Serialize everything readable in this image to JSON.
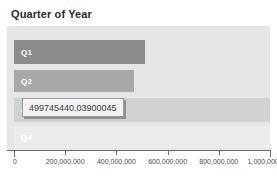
{
  "chart_data": {
    "type": "bar",
    "orientation": "horizontal",
    "title": "Quarter of Year",
    "xlabel": "",
    "ylabel": "",
    "categories": [
      "Q1",
      "Q2",
      "Q3",
      "Q4"
    ],
    "values": [
      513000000,
      468000000,
      1000000000,
      1060000000
    ],
    "xlim": [
      0,
      1060000000
    ],
    "axis_max_tick": 1000000000,
    "grid": false,
    "legend": "none",
    "tick_values": [
      0,
      200000000,
      400000000,
      600000000,
      800000000,
      1000000000
    ],
    "tick_labels": [
      "0",
      "200,000,000",
      "400,000,000",
      "600,000,000",
      "800,000,000",
      "1,000,000,000"
    ],
    "bars": [
      {
        "label": "Q1",
        "value": 513000000,
        "color": "#8c8c8c",
        "label_color": "#ffffff"
      },
      {
        "label": "Q2",
        "value": 468000000,
        "color": "#a8a8a8",
        "label_color": "#ffffff"
      },
      {
        "label": "Q3",
        "value": 1000000000,
        "color": "#d2d2d2",
        "label_color": "#ffffff"
      },
      {
        "label": "Q4",
        "value": 1060000000,
        "color": "#ececec",
        "label_color": "#ffffff"
      }
    ],
    "annotations": [
      {
        "name": "value-tooltip",
        "text": "499745440.03900045",
        "attached_to": "Q3"
      }
    ],
    "plot_background": "#e6e6e6",
    "page_background": "#ffffff"
  },
  "tooltip": {
    "value_text": "499745440.03900045"
  }
}
